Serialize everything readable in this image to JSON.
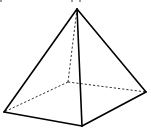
{
  "diagram": {
    "type": "square-pyramid",
    "vertices": {
      "apex": [
        77,
        9
      ],
      "front_left": [
        4,
        112
      ],
      "front_bottom": [
        82,
        126
      ],
      "right": [
        146,
        92
      ],
      "back": [
        68,
        82
      ]
    },
    "visible_edges": [
      [
        "apex",
        "front_left"
      ],
      [
        "apex",
        "front_bottom"
      ],
      [
        "apex",
        "right"
      ],
      [
        "front_left",
        "front_bottom"
      ],
      [
        "front_bottom",
        "right"
      ]
    ],
    "hidden_edges": [
      [
        "apex",
        "back"
      ],
      [
        "back",
        "front_left"
      ],
      [
        "back",
        "right"
      ]
    ],
    "colors": {
      "stroke": "#000000",
      "background": "#ffffff"
    }
  }
}
